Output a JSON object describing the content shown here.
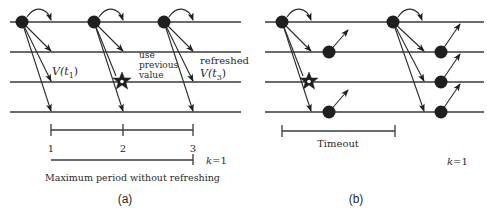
{
  "figure": {
    "panels": [
      {
        "id": "a",
        "caption": "(a)",
        "annotations": {
          "v_t1": {
            "v": "V(",
            "t": "t",
            "sub": "1",
            "close": ")"
          },
          "use_previous_value": [
            "use",
            "previous",
            "value"
          ],
          "refreshed": "refreshed",
          "v_t3": {
            "v": "V(",
            "t": "t",
            "sub": "3",
            "close": ")"
          }
        },
        "scale": {
          "ticks": [
            "1",
            "2",
            "3"
          ],
          "k_label": {
            "k": "k",
            "eq": "=1"
          },
          "bottom_label": "Maximum period without refreshing"
        }
      },
      {
        "id": "b",
        "caption": "(b)",
        "scale": {
          "label": "Timeout",
          "k_label": {
            "k": "k",
            "eq": "=1"
          }
        }
      }
    ],
    "colors": {
      "line": "#3a3a3a",
      "node": "#1f1f1f",
      "background": "#ffffff"
    }
  }
}
